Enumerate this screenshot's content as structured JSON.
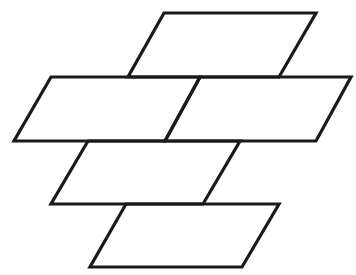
{
  "diagram": {
    "stroke_color": "#1a1a1a",
    "background": "#ffffff",
    "shapes": [
      {
        "id": "top",
        "points": "164,13 316,13 279,77 128,77"
      },
      {
        "id": "middle-left",
        "points": "51,77 200,77 165,141 14,141"
      },
      {
        "id": "middle-right",
        "points": "200,77 351,77 316,141 165,141"
      },
      {
        "id": "third",
        "points": "88,141 240,141 203,204 51,204"
      },
      {
        "id": "bottom",
        "points": "126,204 279,204 242,267 90,267"
      }
    ]
  }
}
